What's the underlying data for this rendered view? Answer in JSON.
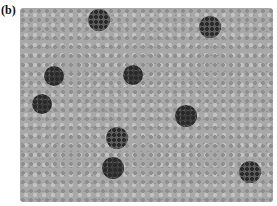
{
  "panel_label": "(b)",
  "image": {
    "description": "Grayscale micrograph-like image of a dense field of light gray particles with several dark clusters",
    "background_color": "#a8a8a8",
    "clusters": [
      {
        "x": 99,
        "y": 20,
        "r": 11,
        "tone": "mixed"
      },
      {
        "x": 210,
        "y": 27,
        "r": 11,
        "tone": "mixed"
      },
      {
        "x": 54,
        "y": 76,
        "r": 10,
        "tone": "dark"
      },
      {
        "x": 133,
        "y": 75,
        "r": 10,
        "tone": "dark"
      },
      {
        "x": 42,
        "y": 104,
        "r": 10,
        "tone": "dark"
      },
      {
        "x": 186,
        "y": 116,
        "r": 11,
        "tone": "dark"
      },
      {
        "x": 117,
        "y": 138,
        "r": 11,
        "tone": "mixed"
      },
      {
        "x": 113,
        "y": 168,
        "r": 11,
        "tone": "dark"
      },
      {
        "x": 250,
        "y": 172,
        "r": 11,
        "tone": "mixed"
      }
    ]
  }
}
